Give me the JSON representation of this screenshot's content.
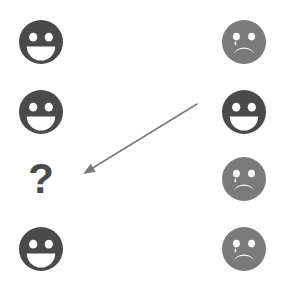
{
  "canvas": {
    "width": 284,
    "height": 289,
    "background": "#ffffff"
  },
  "colors": {
    "face_dark": "#4a4a4a",
    "face_gray": "#7a7a7a",
    "arrow": "#7a7a7a",
    "feature_fill": "#ffffff"
  },
  "grid": {
    "columns": 2,
    "rows": 4,
    "left_column_center_x": 41,
    "right_column_center_x": 244,
    "row_center_y": [
      42,
      112,
      179,
      249
    ]
  },
  "items": [
    {
      "id": "left-row-1",
      "icon": "happy-face-icon",
      "label": "happy face",
      "column": "left",
      "row": 1,
      "color": "#4a4a4a",
      "x": 17,
      "y": 18
    },
    {
      "id": "left-row-2",
      "icon": "happy-face-icon",
      "label": "happy face",
      "column": "left",
      "row": 2,
      "color": "#4a4a4a",
      "x": 17,
      "y": 88
    },
    {
      "id": "left-row-3",
      "icon": "question-mark-icon",
      "label": "question mark",
      "glyph": "?",
      "column": "left",
      "row": 3,
      "color": "#4a4a4a",
      "x": 17,
      "y": 155
    },
    {
      "id": "left-row-4",
      "icon": "happy-face-icon",
      "label": "happy face",
      "column": "left",
      "row": 4,
      "color": "#4a4a4a",
      "x": 17,
      "y": 225
    },
    {
      "id": "right-row-1",
      "icon": "sad-face-icon",
      "label": "sad face with tear",
      "column": "right",
      "row": 1,
      "color": "#7a7a7a",
      "x": 220,
      "y": 18
    },
    {
      "id": "right-row-2",
      "icon": "happy-face-icon",
      "label": "happy face",
      "column": "right",
      "row": 2,
      "color": "#4a4a4a",
      "x": 220,
      "y": 88
    },
    {
      "id": "right-row-3",
      "icon": "sad-face-icon",
      "label": "sad face with tear",
      "column": "right",
      "row": 3,
      "color": "#7a7a7a",
      "x": 220,
      "y": 155
    },
    {
      "id": "right-row-4",
      "icon": "sad-face-icon",
      "label": "sad face with tear",
      "column": "right",
      "row": 4,
      "color": "#7a7a7a",
      "x": 220,
      "y": 225
    }
  ],
  "arrow": {
    "icon": "arrow-icon",
    "label": "arrow pointing down-left",
    "color": "#7a7a7a",
    "stroke_width": 1.6,
    "tail_x": 197,
    "tail_y": 104,
    "head_x": 83,
    "head_y": 174
  }
}
